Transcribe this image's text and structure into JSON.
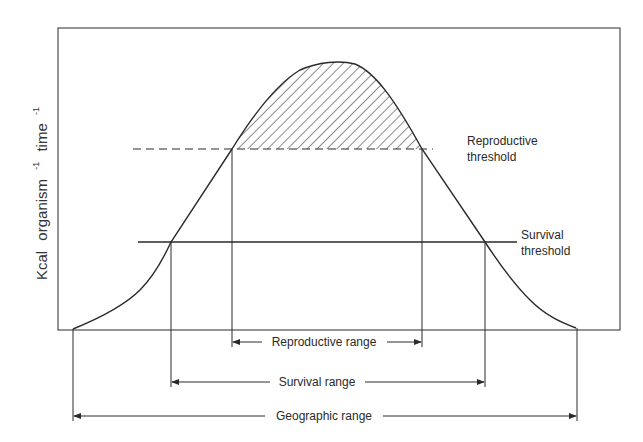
{
  "diagram": {
    "y_axis": {
      "label_main": "Kcal",
      "label_part1": "organism",
      "label_sup1": "-1",
      "label_part2": "time",
      "label_sup2": "-1"
    },
    "thresholds": {
      "reproductive": {
        "line1": "Reproductive",
        "line2": "threshold",
        "style": "dashed"
      },
      "survival": {
        "line1": "Survival",
        "line2": "threshold",
        "style": "solid"
      }
    },
    "ranges": {
      "reproductive": "Reproductive range",
      "survival": "Survival range",
      "geographic": "Geographic range"
    },
    "colors": {
      "line": "#2a2a2a",
      "background": "#ffffff"
    }
  }
}
